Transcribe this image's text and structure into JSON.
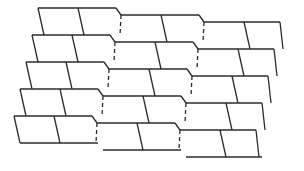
{
  "diagram": {
    "title": "",
    "rows": 5,
    "groups_per_row": 3,
    "stroke_color": "#2b2b2b",
    "background": "#ffffff",
    "origin": [
      38,
      8
    ],
    "row_step": [
      -6,
      27
    ],
    "group_step": [
      83,
      7
    ],
    "cell_height": 27,
    "left_slant": 6,
    "notch": [
      5,
      7
    ],
    "inner_divider_offset": 40,
    "inner_divider_slant": 6,
    "right_end_slant": 3,
    "last_cell_width": 36
  }
}
